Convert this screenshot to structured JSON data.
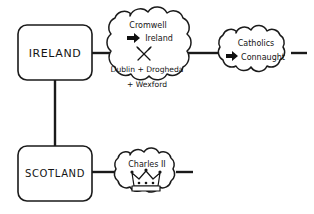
{
  "diagram": {
    "background_color": "#ffffff",
    "ink_color": "#1a1a1a",
    "nodes": [
      {
        "id": "ireland",
        "shape": "rounded-box",
        "label": "IRELAND"
      },
      {
        "id": "scotland",
        "shape": "rounded-box",
        "label": "SCOTLAND"
      }
    ],
    "clouds": [
      {
        "id": "cromwell-ireland",
        "shape": "cloud",
        "lines": [
          "Cromwell",
          "Ireland",
          "Dublin + Drogheda",
          "+ Wexford"
        ],
        "arrow_icon": "right-arrow-icon",
        "symbol_icon": "crossed-swords-icon"
      },
      {
        "id": "catholics-connaught",
        "shape": "cloud",
        "lines": [
          "Catholics",
          "Connaught"
        ],
        "arrow_icon": "right-arrow-icon"
      },
      {
        "id": "charles-ii",
        "shape": "cloud",
        "lines": [
          "Charles II"
        ],
        "symbol_icon": "crown-icon"
      }
    ],
    "connectors": [
      {
        "id": "ireland-to-cromwell",
        "from": "ireland",
        "to": "cromwell-ireland",
        "orientation": "horizontal"
      },
      {
        "id": "ireland-to-scotland",
        "from": "ireland",
        "to": "scotland",
        "orientation": "vertical"
      },
      {
        "id": "cromwell-to-catholics",
        "from": "cromwell-ireland",
        "to": "catholics-connaught",
        "orientation": "horizontal"
      },
      {
        "id": "catholics-stub",
        "from": "catholics-connaught",
        "to": "",
        "orientation": "horizontal"
      },
      {
        "id": "scotland-to-charles",
        "from": "scotland",
        "to": "charles-ii",
        "orientation": "horizontal"
      },
      {
        "id": "charles-stub",
        "from": "charles-ii",
        "to": "",
        "orientation": "horizontal"
      }
    ]
  }
}
